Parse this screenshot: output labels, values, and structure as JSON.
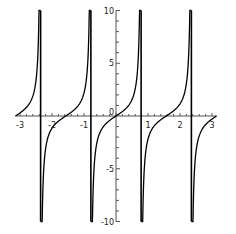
{
  "chart_data": {
    "type": "line",
    "title": "",
    "xlabel": "",
    "ylabel": "",
    "function": "tan(2x)",
    "xlim": [
      -3.14159,
      3.14159
    ],
    "ylim": [
      -10,
      10
    ],
    "grid": false,
    "legend": null,
    "x_ticks": [
      -3,
      -2,
      -1,
      0,
      1,
      2,
      3
    ],
    "x_tick_labels": [
      "-3",
      "-2",
      "-1",
      "0",
      "1",
      "2",
      "3"
    ],
    "y_ticks": [
      -10,
      -5,
      5,
      10
    ],
    "y_tick_labels": [
      "-10",
      "-5",
      "5",
      "10"
    ],
    "vertical_asymptotes": [
      -2.356,
      -0.785,
      0.785,
      2.356
    ],
    "series": [
      {
        "name": "tan(2x)",
        "color": "#000000",
        "x": [
          -3.1416,
          -3.0,
          -2.8,
          -2.6,
          -2.5,
          -2.45,
          -2.4,
          -2.37,
          -2.34,
          -2.3,
          -2.2,
          -2.0,
          -1.8,
          -1.6,
          -1.5,
          -1.4,
          -1.2,
          -1.0,
          -0.9,
          -0.83,
          -0.8,
          -0.77,
          -0.74,
          -0.7,
          -0.6,
          -0.4,
          -0.2,
          0.0,
          0.2,
          0.4,
          0.6,
          0.7,
          0.74,
          0.77,
          0.8,
          0.83,
          0.9,
          1.0,
          1.2,
          1.4,
          1.6,
          1.8,
          2.0,
          2.2,
          2.3,
          2.34,
          2.37,
          2.4,
          2.5,
          2.7,
          2.9,
          3.1416
        ],
        "y": [
          0.0,
          0.29,
          0.67,
          1.59,
          3.38,
          5.28,
          11.38,
          null,
          -8.8,
          -5.1,
          -2.1,
          -1.16,
          -0.59,
          0.17,
          0.14,
          0.36,
          -0.92,
          2.19,
          -4.29,
          null,
          -34.2,
          16.4,
          9.0,
          5.8,
          2.57,
          1.03,
          0.42,
          0.0,
          -0.42,
          -1.03,
          -2.57,
          -5.8,
          -9.0,
          -16.4,
          34.2,
          null,
          4.29,
          -2.19,
          -0.92,
          -0.36,
          -0.14,
          -0.17,
          0.59,
          1.16,
          2.1,
          5.1,
          8.8,
          null,
          -11.38,
          -3.38,
          -0.79,
          0.0
        ]
      }
    ],
    "axis_color": "#555555",
    "curve_color": "#000000"
  },
  "axes": {
    "x_labels": [
      "-3",
      "-2",
      "-1",
      "0",
      "1",
      "2",
      "3"
    ],
    "y_labels": [
      "10",
      "5",
      "-5",
      "-10"
    ]
  }
}
